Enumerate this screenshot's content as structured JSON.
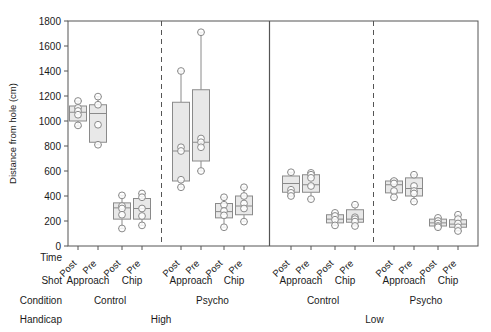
{
  "figure": {
    "type": "boxplot-grouped",
    "background": "#ffffff",
    "box_fill": "#e8e8e8",
    "box_stroke": "#8a8a8a",
    "point_stroke": "#8a8a8a",
    "point_fill": "#ffffff",
    "axis_color": "#555555"
  },
  "axes": {
    "ylabel": "Distance from hole (cm)",
    "yticks": [
      0,
      200,
      400,
      600,
      800,
      1000,
      1200,
      1400,
      1600,
      1800
    ],
    "ylim": [
      0,
      1800
    ],
    "grid": false
  },
  "row_labels": {
    "time": "Time",
    "shot": "Shot",
    "condition": "Condition",
    "handicap": "Handicap"
  },
  "row_values": {
    "time": [
      "Post",
      "Pre",
      "Post",
      "Pre",
      "Post",
      "Pre",
      "Post",
      "Pre",
      "Post",
      "Pre",
      "Post",
      "Pre",
      "Post",
      "Pre",
      "Post",
      "Pre"
    ],
    "shot": [
      "Approach",
      "Chip",
      "Approach",
      "Chip",
      "Approach",
      "Chip",
      "Approach",
      "Chip"
    ],
    "condition": [
      "Control",
      "Psycho",
      "Control",
      "Psycho"
    ],
    "handicap": [
      "High",
      "Low"
    ]
  },
  "chart_data": {
    "type": "boxplot",
    "title": "",
    "xlabel": "",
    "ylabel": "Distance from hole (cm)",
    "ylim": [
      0,
      1800
    ],
    "yticks": [
      0,
      200,
      400,
      600,
      800,
      1000,
      1200,
      1400,
      1600,
      1800
    ],
    "grid": false,
    "legend": "none",
    "factors": [
      "Handicap",
      "Condition",
      "Shot",
      "Time"
    ],
    "boxes": [
      {
        "handicap": "High",
        "condition": "Control",
        "shot": "Approach",
        "time": "Post",
        "x": 78,
        "min": 960,
        "q1": 1000,
        "median": 1070,
        "q3": 1120,
        "max": 1160,
        "points": [
          1160,
          1105,
          1080,
          1050,
          965
        ]
      },
      {
        "handicap": "High",
        "condition": "Control",
        "shot": "Approach",
        "time": "Pre",
        "x": 98,
        "min": 810,
        "q1": 830,
        "median": 1060,
        "q3": 1130,
        "max": 1195,
        "points": [
          1195,
          1130,
          970,
          810
        ]
      },
      {
        "handicap": "High",
        "condition": "Control",
        "shot": "Chip",
        "time": "Post",
        "x": 122,
        "min": 140,
        "q1": 215,
        "median": 305,
        "q3": 345,
        "max": 405,
        "points": [
          405,
          320,
          300,
          250,
          140
        ]
      },
      {
        "handicap": "High",
        "condition": "Control",
        "shot": "Chip",
        "time": "Pre",
        "x": 142,
        "min": 165,
        "q1": 215,
        "median": 300,
        "q3": 380,
        "max": 420,
        "points": [
          420,
          390,
          300,
          240,
          165
        ]
      },
      {
        "handicap": "High",
        "condition": "Psycho",
        "shot": "Approach",
        "time": "Post",
        "x": 181,
        "min": 470,
        "q1": 520,
        "median": 760,
        "q3": 1150,
        "max": 1400,
        "points": [
          1400,
          790,
          760,
          530,
          470
        ]
      },
      {
        "handicap": "High",
        "condition": "Psycho",
        "shot": "Approach",
        "time": "Pre",
        "x": 201,
        "min": 600,
        "q1": 680,
        "median": 830,
        "q3": 1250,
        "max": 1710,
        "points": [
          1710,
          860,
          830,
          790,
          600
        ]
      },
      {
        "handicap": "High",
        "condition": "Psycho",
        "shot": "Chip",
        "time": "Post",
        "x": 224,
        "min": 150,
        "q1": 225,
        "median": 275,
        "q3": 340,
        "max": 390,
        "points": [
          390,
          330,
          280,
          245,
          150
        ]
      },
      {
        "handicap": "High",
        "condition": "Psycho",
        "shot": "Chip",
        "time": "Pre",
        "x": 244,
        "min": 195,
        "q1": 250,
        "median": 320,
        "q3": 400,
        "max": 470,
        "points": [
          470,
          400,
          340,
          300,
          195
        ]
      },
      {
        "handicap": "Low",
        "condition": "Control",
        "shot": "Approach",
        "time": "Post",
        "x": 291,
        "min": 400,
        "q1": 430,
        "median": 500,
        "q3": 560,
        "max": 590,
        "points": [
          590,
          450,
          425,
          400
        ]
      },
      {
        "handicap": "Low",
        "condition": "Control",
        "shot": "Approach",
        "time": "Pre",
        "x": 311,
        "min": 375,
        "q1": 430,
        "median": 490,
        "q3": 570,
        "max": 585,
        "points": [
          585,
          570,
          545,
          480,
          375
        ]
      },
      {
        "handicap": "Low",
        "condition": "Control",
        "shot": "Chip",
        "time": "Post",
        "x": 335,
        "min": 165,
        "q1": 185,
        "median": 215,
        "q3": 250,
        "max": 265,
        "points": [
          265,
          240,
          210,
          165
        ]
      },
      {
        "handicap": "Low",
        "condition": "Control",
        "shot": "Chip",
        "time": "Pre",
        "x": 355,
        "min": 160,
        "q1": 190,
        "median": 215,
        "q3": 290,
        "max": 330,
        "points": [
          330,
          230,
          215,
          195,
          160
        ]
      },
      {
        "handicap": "Low",
        "condition": "Psycho",
        "shot": "Approach",
        "time": "Post",
        "x": 394,
        "min": 390,
        "q1": 425,
        "median": 490,
        "q3": 520,
        "max": 530,
        "points": [
          520,
          500,
          440,
          390
        ]
      },
      {
        "handicap": "Low",
        "condition": "Psycho",
        "shot": "Approach",
        "time": "Pre",
        "x": 414,
        "min": 355,
        "q1": 400,
        "median": 460,
        "q3": 545,
        "max": 570,
        "points": [
          570,
          480,
          440,
          420,
          355
        ]
      },
      {
        "handicap": "Low",
        "condition": "Psycho",
        "shot": "Chip",
        "time": "Post",
        "x": 438,
        "min": 150,
        "q1": 160,
        "median": 185,
        "q3": 215,
        "max": 225,
        "points": [
          225,
          200,
          180,
          160,
          150
        ]
      },
      {
        "handicap": "Low",
        "condition": "Psycho",
        "shot": "Chip",
        "time": "Pre",
        "x": 458,
        "min": 120,
        "q1": 150,
        "median": 175,
        "q3": 210,
        "max": 250,
        "points": [
          250,
          215,
          180,
          150,
          120
        ]
      }
    ]
  }
}
